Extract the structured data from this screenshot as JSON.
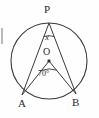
{
  "figure": {
    "type": "circle-geometry-diagram",
    "background_color": "#fefefe",
    "stroke_color": "#3a3a3a",
    "label_color": "#2b2b2b",
    "circle": {
      "center_label": "O",
      "center_x": 49,
      "center_y": 61,
      "radius": 38
    },
    "points": [
      {
        "name": "P",
        "label": "P",
        "x": 49,
        "y": 23
      },
      {
        "name": "A",
        "label": "A",
        "x": 22,
        "y": 95
      },
      {
        "name": "B",
        "label": "B",
        "x": 76,
        "y": 94
      },
      {
        "name": "O",
        "label": "O",
        "x": 49,
        "y": 61
      }
    ],
    "segments": [
      {
        "name": "PA",
        "from": "P",
        "to": "A"
      },
      {
        "name": "PB",
        "from": "P",
        "to": "B"
      },
      {
        "name": "OA",
        "from": "O",
        "to": "A"
      },
      {
        "name": "OB",
        "from": "O",
        "to": "B"
      }
    ],
    "angles": [
      {
        "name": "angle-at-P",
        "vertex": "P",
        "label": "x",
        "arc_radius": 14
      },
      {
        "name": "angle-at-O",
        "vertex": "O",
        "label": "70°",
        "arc_radius": 11
      }
    ],
    "artifact": {
      "name": "scan-artifact-left-edge",
      "x": 1,
      "y": 28,
      "width": 2,
      "height": 16
    }
  }
}
